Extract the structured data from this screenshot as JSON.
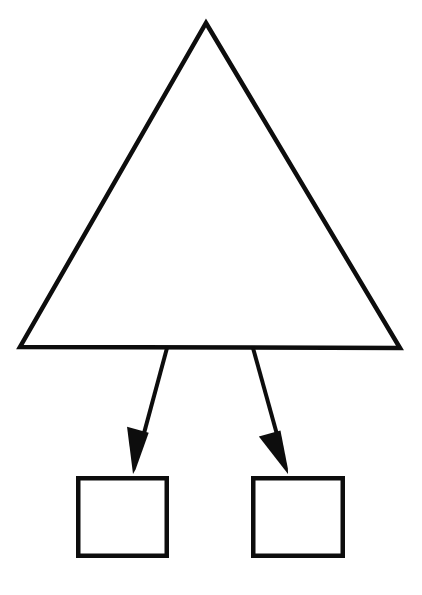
{
  "diagram": {
    "title": "",
    "background_color": "#ffffff",
    "stroke_color": "#0d0d0d",
    "canvas": {
      "width": 422,
      "height": 595
    },
    "nodes": [
      {
        "id": "triangle-node",
        "name": "triangle-shape",
        "type": "triangle",
        "label": "",
        "stroke_width": 4.5,
        "apex": {
          "x": 206,
          "y": 23
        },
        "bottom_left": {
          "x": 20,
          "y": 347
        },
        "bottom_right": {
          "x": 400,
          "y": 348
        }
      },
      {
        "id": "left-box-node",
        "name": "left-rectangle-shape",
        "type": "rectangle",
        "label": "",
        "stroke_width": 4.5,
        "x": 76,
        "y": 476,
        "width": 93,
        "height": 82
      },
      {
        "id": "right-box-node",
        "name": "right-rectangle-shape",
        "type": "rectangle",
        "label": "",
        "stroke_width": 4.5,
        "x": 251,
        "y": 476,
        "width": 94,
        "height": 82
      }
    ],
    "connectors": [
      {
        "id": "connector-left",
        "name": "arrow-triangle-to-left-box",
        "from": "triangle-node",
        "to": "left-box-node",
        "style": "solid",
        "arrowhead": "filled-triangle",
        "stroke_width": 4,
        "start": {
          "x": 167,
          "y": 348
        },
        "end": {
          "x": 133,
          "y": 474
        },
        "head_length": 44,
        "head_width": 22
      },
      {
        "id": "connector-right",
        "name": "arrow-triangle-to-right-box",
        "from": "triangle-node",
        "to": "right-box-node",
        "style": "solid",
        "arrowhead": "filled-triangle",
        "stroke_width": 4,
        "start": {
          "x": 253,
          "y": 348
        },
        "end": {
          "x": 288,
          "y": 474
        },
        "head_length": 44,
        "head_width": 22
      }
    ]
  }
}
